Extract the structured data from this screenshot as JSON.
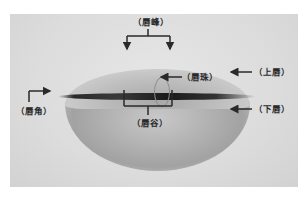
{
  "diagram": {
    "labels": {
      "lip_peak": "（唇峰）",
      "lip_bead": "（唇珠）",
      "upper_lip": "（上唇）",
      "lip_corner": "（唇角）",
      "lip_valley": "（唇谷）",
      "lower_lip": "（下唇）"
    },
    "colors": {
      "annotation": "#2a2a2a",
      "background": "#ffffff",
      "photo_bg": "#dcdcdc"
    }
  }
}
